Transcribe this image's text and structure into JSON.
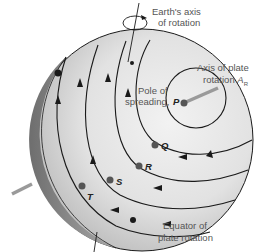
{
  "labels": {
    "earth_axis_line1": "Earth's axis",
    "earth_axis_line2": "of rotation",
    "plate_axis_line1": "Axis of plate",
    "plate_axis_line2": "rotation",
    "plate_axis_symbol": "A",
    "plate_axis_subscript": "R",
    "pole_line1": "Pole of",
    "pole_line2": "spreading,",
    "equator_line1": "Equator of",
    "equator_line2": "plate rotation"
  },
  "points": {
    "P": "P",
    "Q": "Q",
    "R": "R",
    "S": "S",
    "T": "T"
  },
  "colors": {
    "sphere_light": "#ededed",
    "sphere_dark": "#7a7a7a",
    "line": "#1a1a1a",
    "axis_gray": "#9a9a9a",
    "dot": "#555555"
  }
}
